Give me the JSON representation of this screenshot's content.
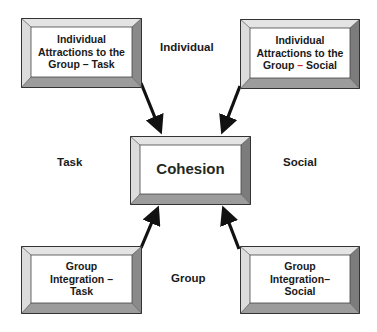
{
  "diagram": {
    "center": {
      "label": "Cohesion"
    },
    "boxes": [
      {
        "id": "top-left",
        "lines": [
          "Individual",
          "Attractions to the",
          "Group – Task"
        ]
      },
      {
        "id": "top-right",
        "lines": [
          "Individual",
          "Attractions to the",
          "Group ",
          "–",
          " Social"
        ]
      },
      {
        "id": "bottom-left",
        "lines": [
          "Group",
          "Integration –",
          "Task"
        ]
      },
      {
        "id": "bottom-right",
        "lines": [
          "Group",
          "Integration–",
          "Social"
        ]
      }
    ],
    "axis_labels": {
      "top": "Individual",
      "left": "Task",
      "right": "Social",
      "bottom": "Group"
    },
    "colors": {
      "bevel_light": "#e8e8e8",
      "bevel_mid": "#b8b8b8",
      "bevel_dark": "#7a7a7a",
      "outline": "#333333",
      "arrow": "#111111",
      "accent_dash": "#d8201a"
    },
    "arrows": [
      {
        "from": "top-left",
        "to": "center"
      },
      {
        "from": "top-right",
        "to": "center"
      },
      {
        "from": "bottom-left",
        "to": "center"
      },
      {
        "from": "bottom-right",
        "to": "center"
      }
    ]
  }
}
